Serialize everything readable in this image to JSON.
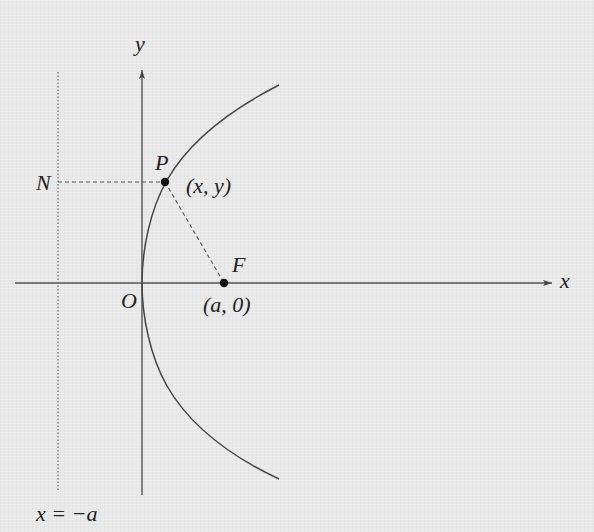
{
  "diagram": {
    "colors": {
      "background": "#e8e8e8",
      "line": "#444444",
      "dashed": "#555555",
      "text": "#222222"
    },
    "axes": {
      "x_label": "x",
      "y_label": "y",
      "origin_label": "O"
    },
    "directrix": {
      "label": "x = −a"
    },
    "points": {
      "P": {
        "name": "P",
        "coords": "(x, y)"
      },
      "F": {
        "name": "F",
        "coords": "(a, 0)"
      },
      "N": {
        "name": "N"
      }
    }
  }
}
